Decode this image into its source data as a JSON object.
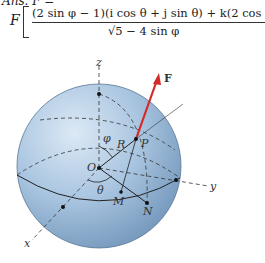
{
  "answer": {
    "prefix": "Ans. F =",
    "coefficient": "F",
    "numerator": "(2 sin φ − 1)(i cos θ + j sin θ) + k(2 cos φ)",
    "denominator": "√5 − 4 sin φ"
  },
  "diagram": {
    "labels": {
      "z": "z",
      "y": "y",
      "x": "x",
      "force": "F",
      "origin": "O",
      "point_p": "P",
      "point_m": "M",
      "point_n": "N",
      "radius": "R",
      "phi": "φ",
      "theta": "θ"
    },
    "colors": {
      "sphere": "#8fb3d4",
      "force_arrow": "#d42a2a",
      "lines": "#222222"
    }
  }
}
